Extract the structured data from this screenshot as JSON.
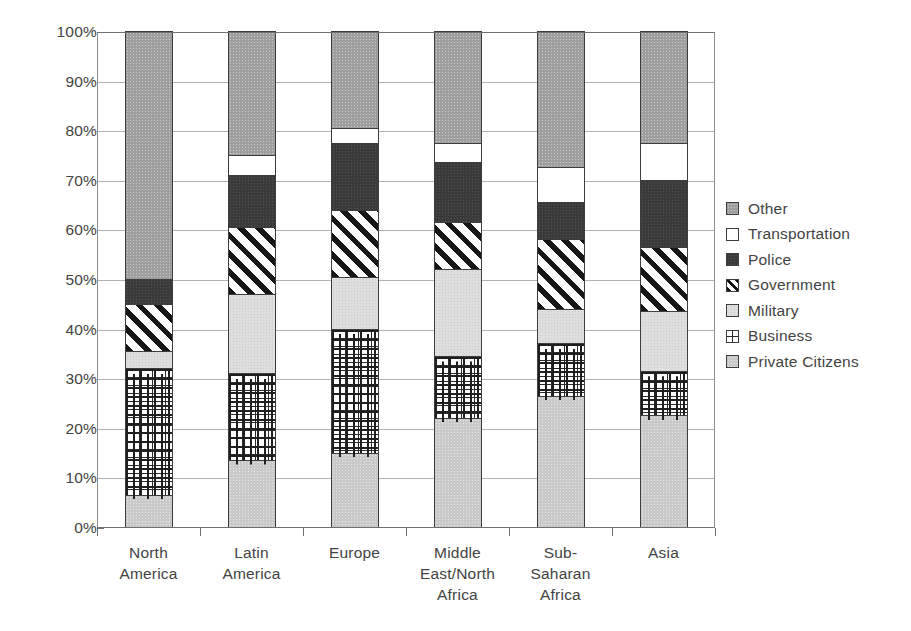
{
  "chart_data": {
    "type": "bar",
    "subtype": "stacked-percentage",
    "title": "",
    "xlabel": "",
    "ylabel": "",
    "ylim": [
      0,
      100
    ],
    "grid": true,
    "legend_position": "right",
    "categories": [
      "North\nAmerica",
      "Latin\nAmerica",
      "Europe",
      "Middle\nEast/North\nAfrica",
      "Sub-\nSaharan\nAfrica",
      "Asia"
    ],
    "y_ticks": [
      "0%",
      "10%",
      "20%",
      "30%",
      "40%",
      "50%",
      "60%",
      "70%",
      "80%",
      "90%",
      "100%"
    ],
    "y_tick_values": [
      0,
      10,
      20,
      30,
      40,
      50,
      60,
      70,
      80,
      90,
      100
    ],
    "series": [
      {
        "name": "Private Citizens",
        "pattern": "light-gray-speckle",
        "values": [
          6.5,
          13.5,
          15.0,
          22.0,
          26.5,
          22.5
        ]
      },
      {
        "name": "Business",
        "pattern": "brick",
        "values": [
          25.5,
          17.5,
          25.0,
          12.5,
          10.5,
          9.0
        ]
      },
      {
        "name": "Military",
        "pattern": "very-light-gray",
        "values": [
          3.5,
          16.0,
          10.5,
          17.5,
          7.0,
          12.0
        ]
      },
      {
        "name": "Government",
        "pattern": "diagonal-hatch",
        "values": [
          9.5,
          13.5,
          13.5,
          9.5,
          14.0,
          13.0
        ]
      },
      {
        "name": "Police",
        "pattern": "dark-gray",
        "values": [
          5.0,
          10.5,
          13.5,
          12.0,
          7.5,
          13.5
        ]
      },
      {
        "name": "Transportation",
        "pattern": "white",
        "values": [
          0.0,
          4.0,
          3.0,
          4.0,
          7.0,
          7.5
        ]
      },
      {
        "name": "Other",
        "pattern": "medium-gray",
        "values": [
          50.0,
          25.0,
          19.5,
          22.5,
          27.5,
          22.5
        ]
      }
    ],
    "stack_order_bottom_to_top": [
      "Private Citizens",
      "Business",
      "Military",
      "Government",
      "Police",
      "Transportation",
      "Other"
    ],
    "legend_order_top_to_bottom": [
      "Other",
      "Transportation",
      "Police",
      "Government",
      "Military",
      "Business",
      "Private Citizens"
    ],
    "cumulative_tops": {
      "North America": {
        "Private Citizens": 6.5,
        "Business": 32.0,
        "Military": 35.5,
        "Government": 45.0,
        "Police": 50.0,
        "Transportation": 50.0,
        "Other": 100
      },
      "Latin America": {
        "Private Citizens": 13.5,
        "Business": 31.0,
        "Military": 47.0,
        "Government": 60.5,
        "Police": 71.0,
        "Transportation": 75.0,
        "Other": 100
      },
      "Europe": {
        "Private Citizens": 15.0,
        "Business": 40.0,
        "Military": 50.5,
        "Government": 64.0,
        "Police": 77.5,
        "Transportation": 80.5,
        "Other": 100
      },
      "Middle East/North Africa": {
        "Private Citizens": 22.0,
        "Business": 34.5,
        "Military": 52.0,
        "Government": 61.5,
        "Police": 73.5,
        "Transportation": 77.5,
        "Other": 100
      },
      "Sub-Saharan Africa": {
        "Private Citizens": 26.5,
        "Business": 37.0,
        "Military": 44.0,
        "Government": 58.0,
        "Police": 65.5,
        "Transportation": 72.5,
        "Other": 100
      },
      "Asia": {
        "Private Citizens": 22.5,
        "Business": 31.5,
        "Military": 43.5,
        "Government": 56.5,
        "Police": 70.0,
        "Transportation": 77.5,
        "Other": 100
      }
    },
    "colors": {
      "other": "#9e9e9e",
      "transportation": "#ffffff",
      "police": "#3a3a3a",
      "government": "#ffffff",
      "military": "#dedede",
      "business": "#ffffff",
      "private_citizens": "#c9c9c9",
      "gridline": "#b2b2b2",
      "axis": "#6f6f6f",
      "text": "#434343",
      "background": "#ffffff"
    }
  }
}
